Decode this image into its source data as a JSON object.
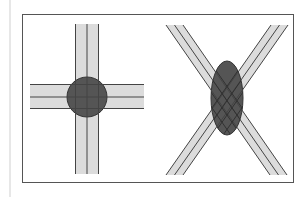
{
  "diagram": {
    "title": "",
    "colors": {
      "background": "#ffffff",
      "frame": "#555555",
      "margin_line": "#cfcfcf",
      "strip_fill": "#dcdcdc",
      "strip_line": "#444444",
      "overlap_fill": "#555555",
      "overlap_stroke": "#333333"
    },
    "panels": [
      {
        "name": "perpendicular-crossing",
        "description": "Two strips crossing at right angles; circular overlap region",
        "overlap_shape": "circle"
      },
      {
        "name": "oblique-crossing",
        "description": "Two strips crossing at an acute angle; elongated elliptical overlap region with lattice",
        "overlap_shape": "ellipse"
      }
    ]
  }
}
